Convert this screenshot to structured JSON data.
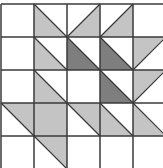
{
  "diagram": {
    "type": "quilt-grid",
    "rows": 5,
    "cols": 5,
    "origin": [
      1,
      4
    ],
    "cell_size": 33,
    "colors": {
      "background": "#ffffff",
      "light": "#c4c4c4",
      "dark": "#7e7e7e",
      "grid_line": "#3a3a3a"
    },
    "cells": [
      {
        "r": 0,
        "c": 0,
        "shape": "none"
      },
      {
        "r": 0,
        "c": 1,
        "shape": "lower-left",
        "fill": "light"
      },
      {
        "r": 0,
        "c": 2,
        "shape": "lower-right",
        "fill": "light"
      },
      {
        "r": 0,
        "c": 3,
        "shape": "lower-right",
        "fill": "light"
      },
      {
        "r": 0,
        "c": 4,
        "shape": "none"
      },
      {
        "r": 1,
        "c": 0,
        "shape": "none"
      },
      {
        "r": 1,
        "c": 1,
        "shape": "lower-left",
        "fill": "light"
      },
      {
        "r": 1,
        "c": 2,
        "shape": "lower-left",
        "fill": "dark"
      },
      {
        "r": 1,
        "c": 3,
        "shape": "lower-left",
        "fill": "dark"
      },
      {
        "r": 1,
        "c": 4,
        "shape": "upper-right-bl",
        "fill": "light"
      },
      {
        "r": 2,
        "c": 0,
        "shape": "none"
      },
      {
        "r": 2,
        "c": 1,
        "shape": "lower-left",
        "fill": "light"
      },
      {
        "r": 2,
        "c": 2,
        "shape": "none"
      },
      {
        "r": 2,
        "c": 3,
        "shape": "lower-left",
        "fill": "dark"
      },
      {
        "r": 2,
        "c": 4,
        "shape": "upper-left-tr",
        "fill": "light"
      },
      {
        "r": 3,
        "c": 0,
        "shape": "upper-right",
        "fill": "light"
      },
      {
        "r": 3,
        "c": 1,
        "shape": "full",
        "fill": "light"
      },
      {
        "r": 3,
        "c": 2,
        "shape": "upper-right",
        "fill": "light"
      },
      {
        "r": 3,
        "c": 3,
        "shape": "lower-left",
        "fill": "light"
      },
      {
        "r": 3,
        "c": 4,
        "shape": "lower-left",
        "fill": "light"
      },
      {
        "r": 4,
        "c": 0,
        "shape": "none"
      },
      {
        "r": 4,
        "c": 1,
        "shape": "upper-right",
        "fill": "light"
      },
      {
        "r": 4,
        "c": 2,
        "shape": "none"
      },
      {
        "r": 4,
        "c": 3,
        "shape": "none"
      },
      {
        "r": 4,
        "c": 4,
        "shape": "none"
      }
    ]
  }
}
